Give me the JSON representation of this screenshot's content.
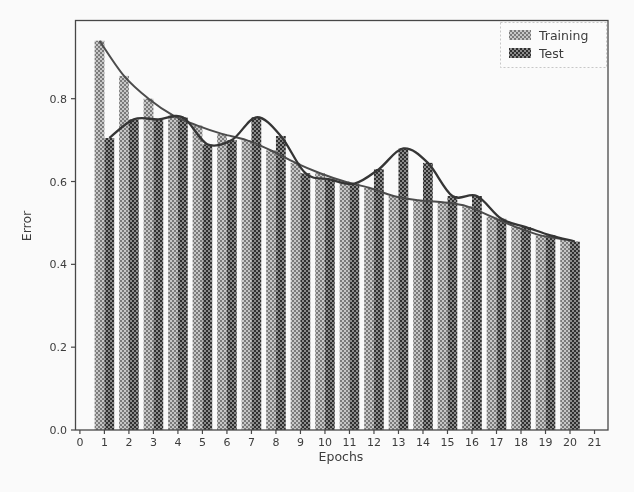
{
  "figure": {
    "type": "scanned-matplotlib-figure",
    "xlabel": "Epochs",
    "ylabel": "Error"
  },
  "legend": {
    "position": "upper-right",
    "items": [
      {
        "label": "Training",
        "series": "training"
      },
      {
        "label": "Test",
        "series": "test"
      }
    ]
  },
  "colors": {
    "background": "#fefefe",
    "axis": "#454545",
    "text": "#3a3a3a",
    "training_line": "#4a4a4a",
    "test_line": "#333333",
    "training_hatch_light": "#c9c9c9",
    "training_hatch_dark": "#7a7a7a",
    "test_hatch_light": "#8c8c8c",
    "test_hatch_dark": "#2e2e2e",
    "legend_border": "#c9c9c9"
  },
  "chart_data": {
    "type": "bar",
    "subtype": "paired-bars-with-lines",
    "title": "",
    "xlabel": "Epochs",
    "ylabel": "Error",
    "grid": false,
    "legend_position": "upper right",
    "xlim": [
      -0.2,
      21.55
    ],
    "ylim": [
      0,
      0.99
    ],
    "x_ticks": [
      0,
      1,
      2,
      3,
      4,
      5,
      6,
      7,
      8,
      9,
      10,
      11,
      12,
      13,
      14,
      15,
      16,
      17,
      18,
      19,
      20,
      21
    ],
    "y_ticks": [
      0.0,
      0.2,
      0.4,
      0.6,
      0.8
    ],
    "categories": [
      1,
      2,
      3,
      4,
      5,
      6,
      7,
      8,
      9,
      10,
      11,
      12,
      13,
      14,
      15,
      16,
      17,
      18,
      19,
      20
    ],
    "series": [
      {
        "name": "Training",
        "render": "bar+line",
        "values": [
          0.94,
          0.855,
          0.8,
          0.76,
          0.735,
          0.715,
          0.7,
          0.675,
          0.645,
          0.62,
          0.6,
          0.585,
          0.565,
          0.555,
          0.55,
          0.54,
          0.515,
          0.49,
          0.47,
          0.46
        ]
      },
      {
        "name": "Test",
        "render": "bar+line",
        "values": [
          0.705,
          0.75,
          0.75,
          0.755,
          0.69,
          0.7,
          0.755,
          0.71,
          0.62,
          0.605,
          0.595,
          0.63,
          0.68,
          0.645,
          0.565,
          0.565,
          0.51,
          0.49,
          0.47,
          0.455
        ]
      }
    ]
  }
}
